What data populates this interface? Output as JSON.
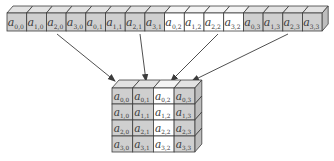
{
  "colors": {
    "gray_face": "#cfcfcf",
    "gray_top": "#e2e2e2",
    "gray_side": "#bdbdbd",
    "white_face": "#ffffff",
    "white_top": "#f4f4f4",
    "stroke": "#3c3c3c",
    "arrow": "#3c3c3c",
    "text": "#3a3a3a"
  },
  "strip": {
    "x": 7,
    "y": 13,
    "cell_w": 19.7,
    "cell_h": 18,
    "depth_x": 6,
    "depth_y": 7,
    "cells": [
      {
        "row": "0",
        "col": "0",
        "highlight": false
      },
      {
        "row": "1",
        "col": "0",
        "highlight": false
      },
      {
        "row": "2",
        "col": "0",
        "highlight": false
      },
      {
        "row": "3",
        "col": "0",
        "highlight": false
      },
      {
        "row": "0",
        "col": "1",
        "highlight": false
      },
      {
        "row": "1",
        "col": "1",
        "highlight": false
      },
      {
        "row": "2",
        "col": "1",
        "highlight": false
      },
      {
        "row": "3",
        "col": "1",
        "highlight": false
      },
      {
        "row": "0",
        "col": "2",
        "highlight": true
      },
      {
        "row": "1",
        "col": "2",
        "highlight": true
      },
      {
        "row": "2",
        "col": "2",
        "highlight": true
      },
      {
        "row": "3",
        "col": "2",
        "highlight": true
      },
      {
        "row": "0",
        "col": "3",
        "highlight": false
      },
      {
        "row": "1",
        "col": "3",
        "highlight": false
      },
      {
        "row": "2",
        "col": "3",
        "highlight": false
      },
      {
        "row": "3",
        "col": "3",
        "highlight": false
      }
    ]
  },
  "matrix": {
    "x": 112,
    "y": 88,
    "cell_w": 20.7,
    "cell_h": 16,
    "depth_x": 7,
    "depth_y": 8,
    "rows": 4,
    "cols": 4,
    "highlight_col": 2,
    "labels": [
      [
        {
          "row": "0",
          "col": "0"
        },
        {
          "row": "0",
          "col": "1"
        },
        {
          "row": "0",
          "col": "2"
        },
        {
          "row": "0",
          "col": "3"
        }
      ],
      [
        {
          "row": "1",
          "col": "0"
        },
        {
          "row": "1",
          "col": "1"
        },
        {
          "row": "1",
          "col": "2"
        },
        {
          "row": "1",
          "col": "3"
        }
      ],
      [
        {
          "row": "2",
          "col": "0"
        },
        {
          "row": "2",
          "col": "1"
        },
        {
          "row": "2",
          "col": "2"
        },
        {
          "row": "2",
          "col": "3"
        }
      ],
      [
        {
          "row": "3",
          "col": "0"
        },
        {
          "row": "3",
          "col": "1"
        },
        {
          "row": "3",
          "col": "2"
        },
        {
          "row": "3",
          "col": "3"
        }
      ]
    ]
  },
  "arrows": [
    {
      "from": [
        57,
        34
      ],
      "to": [
        115,
        81
      ]
    },
    {
      "from": [
        140,
        34
      ],
      "to": [
        146,
        81
      ]
    },
    {
      "from": [
        218,
        34
      ],
      "to": [
        171,
        81
      ]
    },
    {
      "from": [
        288,
        34
      ],
      "to": [
        192,
        81
      ]
    }
  ],
  "label_prefix": "a"
}
